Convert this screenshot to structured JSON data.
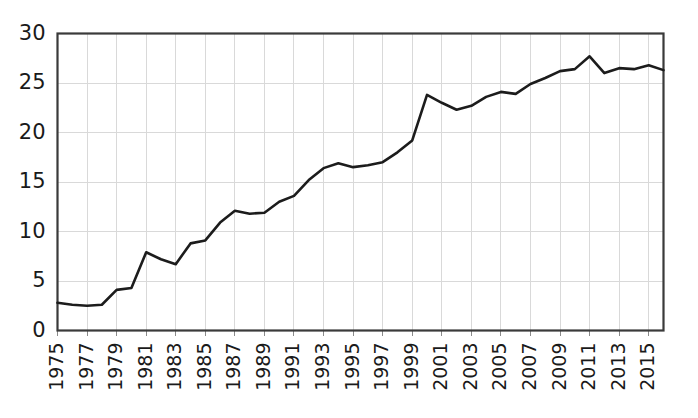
{
  "chart_data": {
    "type": "line",
    "title": "",
    "subtitle": "",
    "xlabel": "",
    "ylabel": "",
    "xlim": [
      1975,
      2016
    ],
    "ylim": [
      0,
      30
    ],
    "yticks": [
      0,
      5,
      10,
      15,
      20,
      25,
      30
    ],
    "xticks": [
      1975,
      1977,
      1979,
      1981,
      1983,
      1985,
      1987,
      1989,
      1991,
      1993,
      1995,
      1997,
      1999,
      2001,
      2003,
      2005,
      2007,
      2009,
      2011,
      2013,
      2015
    ],
    "xtick_labels": [
      "1975",
      "1977",
      "1979",
      "1981",
      "1983",
      "1985",
      "1987",
      "1989",
      "1991",
      "1993",
      "1995",
      "1997",
      "1999",
      "2001",
      "2003",
      "2005",
      "2007",
      "2009",
      "2011",
      "2013",
      "2015"
    ],
    "ytick_labels": [
      "0",
      "5",
      "10",
      "15",
      "20",
      "25",
      "30"
    ],
    "grid": true,
    "grid_axis": "both",
    "legend": false,
    "legend_position": "none",
    "line_color": "#1c1c1c",
    "grid_color": "#d9d9d9",
    "frame_color": "#3a3a3a",
    "x": [
      1975,
      1976,
      1977,
      1978,
      1979,
      1980,
      1981,
      1982,
      1983,
      1984,
      1985,
      1986,
      1987,
      1988,
      1989,
      1990,
      1991,
      1992,
      1993,
      1994,
      1995,
      1996,
      1997,
      1998,
      1999,
      2000,
      2001,
      2002,
      2003,
      2004,
      2005,
      2006,
      2007,
      2008,
      2009,
      2010,
      2011,
      2012,
      2013,
      2014,
      2015,
      2016
    ],
    "values": [
      2.8,
      2.6,
      2.5,
      2.6,
      4.1,
      4.3,
      7.9,
      7.2,
      6.7,
      8.8,
      9.1,
      10.9,
      12.1,
      11.8,
      11.9,
      13.0,
      13.6,
      15.2,
      16.4,
      16.9,
      16.5,
      16.7,
      17.0,
      18.0,
      19.2,
      23.8,
      23.0,
      22.3,
      22.7,
      23.6,
      24.1,
      23.9,
      24.9,
      25.5,
      26.2,
      26.4,
      27.7,
      26.0,
      26.5,
      26.4,
      26.8,
      26.3
    ],
    "series": [
      {
        "name": "series-1",
        "values": [
          2.8,
          2.6,
          2.5,
          2.6,
          4.1,
          4.3,
          7.9,
          7.2,
          6.7,
          8.8,
          9.1,
          10.9,
          12.1,
          11.8,
          11.9,
          13.0,
          13.6,
          15.2,
          16.4,
          16.9,
          16.5,
          16.7,
          17.0,
          18.0,
          19.2,
          23.8,
          23.0,
          22.3,
          22.7,
          23.6,
          24.1,
          23.9,
          24.9,
          25.5,
          26.2,
          26.4,
          27.7,
          26.0,
          26.5,
          26.4,
          26.8,
          26.3
        ]
      }
    ]
  }
}
